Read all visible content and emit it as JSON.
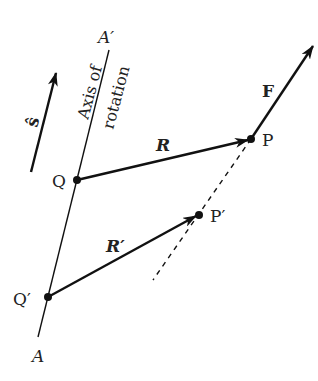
{
  "diagram": {
    "type": "vector-geometry",
    "labels": {
      "axis_top": "A′",
      "axis_bottom": "A",
      "axis_caption_line1": "Axis of",
      "axis_caption_line2": "rotation",
      "unit_vector": "ŝ",
      "point_Q": "Q",
      "point_Q_prime": "Q′",
      "point_P": "P",
      "point_P_prime": "P′",
      "vector_R": "R",
      "vector_R_prime": "R′",
      "vector_F": "F"
    },
    "points": {
      "A_prime_end": [
        109,
        50
      ],
      "A_end": [
        38,
        337
      ],
      "Q": [
        77,
        180
      ],
      "Q_prime": [
        48,
        297
      ],
      "P": [
        251,
        139
      ],
      "P_prime": [
        199,
        215
      ],
      "F_tip": [
        313,
        46
      ],
      "s_hat_tail": [
        31,
        172
      ],
      "s_hat_tip": [
        56,
        73
      ],
      "dashed_line_end": [
        153,
        280
      ]
    },
    "colors": {
      "ink": "#111111",
      "background": "#ffffff"
    }
  }
}
